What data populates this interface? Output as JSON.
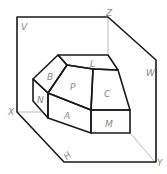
{
  "diagram": {
    "type": "orthographic-projection-planes",
    "plane_labels": {
      "v": "V",
      "w": "W",
      "h": "H"
    },
    "axis_labels": {
      "x": "X",
      "y": "Y",
      "z": "Z"
    },
    "face_labels": {
      "b": "B",
      "p": "P",
      "l": "L",
      "n": "N",
      "c": "C",
      "a": "A",
      "m": "M"
    },
    "colors": {
      "line": "#1a1a1a",
      "label": "#888888",
      "background": "#ffffff"
    }
  }
}
